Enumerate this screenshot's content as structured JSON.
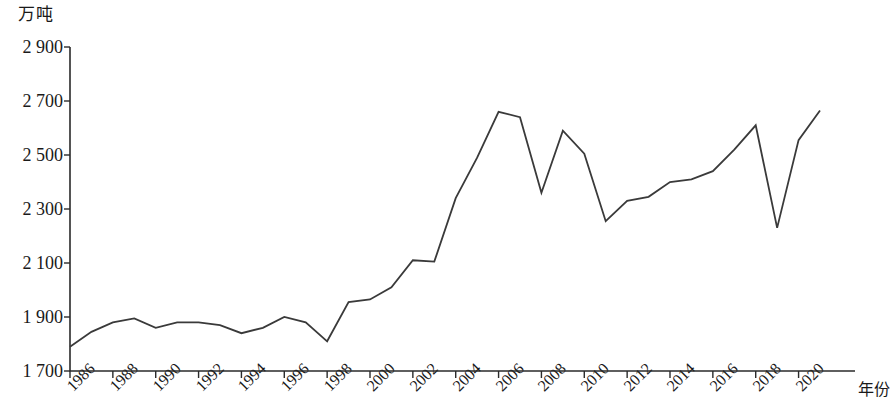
{
  "chart_data": {
    "type": "line",
    "title": "",
    "subtitle": "",
    "xlabel": "年份",
    "ylabel": "万吨",
    "unit_label": "万吨",
    "x": [
      1986,
      1987,
      1988,
      1989,
      1990,
      1991,
      1992,
      1993,
      1994,
      1995,
      1996,
      1997,
      1998,
      1999,
      2000,
      2001,
      2002,
      2003,
      2004,
      2005,
      2006,
      2007,
      2008,
      2009,
      2010,
      2011,
      2012,
      2013,
      2014,
      2015,
      2016,
      2017,
      2018,
      2019,
      2020,
      2021
    ],
    "values": [
      1790,
      1845,
      1880,
      1895,
      1860,
      1880,
      1880,
      1870,
      1840,
      1860,
      1900,
      1880,
      1810,
      1955,
      1965,
      2010,
      2110,
      2105,
      2340,
      2490,
      2660,
      2640,
      2360,
      2590,
      2505,
      2255,
      2330,
      2345,
      2400,
      2410,
      2440,
      2520,
      2610,
      2230,
      2555,
      2665
    ],
    "series": [
      {
        "name": "产量",
        "values": [
          1790,
          1845,
          1880,
          1895,
          1860,
          1880,
          1880,
          1870,
          1840,
          1860,
          1900,
          1880,
          1810,
          1955,
          1965,
          2010,
          2110,
          2105,
          2340,
          2490,
          2660,
          2640,
          2360,
          2590,
          2505,
          2255,
          2330,
          2345,
          2400,
          2410,
          2440,
          2520,
          2610,
          2230,
          2555,
          2665
        ],
        "color": "#3a3a3a"
      }
    ],
    "xlim": [
      1986,
      2021
    ],
    "ylim": [
      1700,
      2900
    ],
    "ytick_labels": [
      "1 700",
      "1 900",
      "2 100",
      "2 300",
      "2 500",
      "2 700",
      "2 900"
    ],
    "ytick_values": [
      1700,
      1900,
      2100,
      2300,
      2500,
      2700,
      2900
    ],
    "xtick_labels": [
      "1986",
      "1988",
      "1990",
      "1992",
      "1994",
      "1996",
      "1998",
      "2000",
      "2002",
      "2004",
      "2006",
      "2008",
      "2010",
      "2012",
      "2014",
      "2016",
      "2018",
      "2020"
    ],
    "xtick_values": [
      1986,
      1988,
      1990,
      1992,
      1994,
      1996,
      1998,
      2000,
      2002,
      2004,
      2006,
      2008,
      2010,
      2012,
      2014,
      2016,
      2018,
      2020
    ],
    "grid": false,
    "legend": false,
    "legend_position": "none",
    "line_color": "#3a3a3a",
    "axis_color": "#2b2b2b",
    "background": "#ffffff"
  }
}
